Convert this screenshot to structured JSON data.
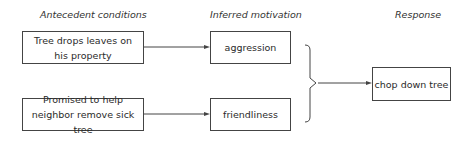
{
  "headers": {
    "antecedent": "Antecedent conditions",
    "motivation": "Inferred motivation",
    "response": "Response"
  },
  "antecedents": [
    {
      "label": "Tree drops leaves on his property"
    },
    {
      "label": "Promised to help neighbor remove sick tree"
    }
  ],
  "motivations": [
    {
      "label": "aggression"
    },
    {
      "label": "friendliness"
    }
  ],
  "response": {
    "label": "chop down tree"
  },
  "colors": {
    "line": "#444444",
    "text": "#2a2a2a",
    "background": "#ffffff"
  }
}
